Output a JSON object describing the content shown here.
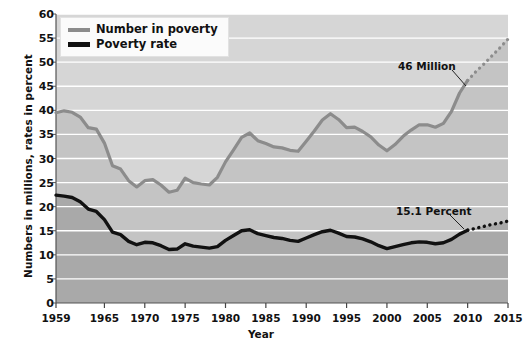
{
  "chart_data": {
    "type": "line",
    "title": "",
    "xlabel": "Year",
    "ylabel": "Numbers in millions, rates in percent",
    "xlim": [
      1959,
      2015
    ],
    "ylim": [
      0,
      60
    ],
    "ytick_step": 5,
    "grid": true,
    "legend_position": "top-left",
    "yticks": [
      "60",
      "55",
      "50",
      "45",
      "40",
      "35",
      "30",
      "25",
      "20",
      "15",
      "10",
      "5",
      "0"
    ],
    "xticks": [
      "1959",
      "1965",
      "1970",
      "1975",
      "1980",
      "1985",
      "1990",
      "1995",
      "2000",
      "2005",
      "2010",
      "2015"
    ],
    "x": [
      1959,
      1960,
      1961,
      1962,
      1963,
      1964,
      1965,
      1966,
      1967,
      1968,
      1969,
      1970,
      1971,
      1972,
      1973,
      1974,
      1975,
      1976,
      1977,
      1978,
      1979,
      1980,
      1981,
      1982,
      1983,
      1984,
      1985,
      1986,
      1987,
      1988,
      1989,
      1990,
      1991,
      1992,
      1993,
      1994,
      1995,
      1996,
      1997,
      1998,
      1999,
      2000,
      2001,
      2002,
      2003,
      2004,
      2005,
      2006,
      2007,
      2008,
      2009,
      2010
    ],
    "series": [
      {
        "name": "Number in poverty",
        "color": "#8c8c8c",
        "unit": "millions",
        "values": [
          39.5,
          39.9,
          39.6,
          38.6,
          36.4,
          36.1,
          33.2,
          28.5,
          27.8,
          25.4,
          24.1,
          25.4,
          25.6,
          24.5,
          23.0,
          23.4,
          25.9,
          25.0,
          24.7,
          24.5,
          26.1,
          29.3,
          31.8,
          34.4,
          35.3,
          33.7,
          33.1,
          32.4,
          32.2,
          31.7,
          31.5,
          33.6,
          35.7,
          38.0,
          39.3,
          38.1,
          36.4,
          36.5,
          35.6,
          34.5,
          32.8,
          31.6,
          32.9,
          34.6,
          35.9,
          37.0,
          37.0,
          36.5,
          37.3,
          39.8,
          43.6,
          46.2
        ]
      },
      {
        "name": "Poverty rate",
        "color": "#111111",
        "unit": "percent",
        "values": [
          22.4,
          22.2,
          21.9,
          21.0,
          19.5,
          19.0,
          17.3,
          14.7,
          14.2,
          12.8,
          12.1,
          12.6,
          12.5,
          11.9,
          11.1,
          11.2,
          12.3,
          11.8,
          11.6,
          11.4,
          11.7,
          13.0,
          14.0,
          15.0,
          15.2,
          14.4,
          14.0,
          13.6,
          13.4,
          13.0,
          12.8,
          13.5,
          14.2,
          14.8,
          15.1,
          14.5,
          13.8,
          13.7,
          13.3,
          12.7,
          11.9,
          11.3,
          11.7,
          12.1,
          12.5,
          12.7,
          12.6,
          12.3,
          12.5,
          13.2,
          14.3,
          15.1
        ]
      }
    ],
    "projection": {
      "style": "dotted",
      "x": [
        2010,
        2011,
        2012,
        2013,
        2014,
        2015
      ],
      "number_in_poverty": [
        46.2,
        48.0,
        49.6,
        51.3,
        53.0,
        54.8
      ],
      "poverty_rate": [
        15.1,
        15.5,
        15.9,
        16.3,
        16.6,
        17.0
      ]
    },
    "annotations": [
      {
        "label": "46 Million",
        "x": 2010,
        "y": 46.2,
        "series": "Number in poverty"
      },
      {
        "label": "15.1 Percent",
        "x": 2010,
        "y": 15.1,
        "series": "Poverty rate"
      }
    ],
    "colors": {
      "number_in_poverty_line": "#8c8c8c",
      "poverty_rate_line": "#111111",
      "band_above_gray": "#d6d6d6",
      "band_between": "#c4c4c4",
      "band_below_black": "#a9a9a9",
      "gridline": "#ffffff"
    }
  },
  "legend": {
    "items": [
      {
        "label": "Number in poverty"
      },
      {
        "label": "Poverty rate"
      }
    ]
  },
  "axes": {
    "x_title": "Year",
    "y_title": "Numbers in millions, rates in percent"
  }
}
